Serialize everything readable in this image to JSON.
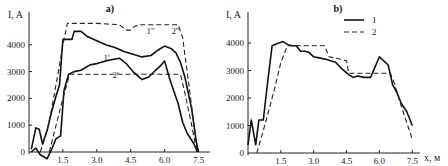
{
  "chart_data": [
    {
      "type": "line",
      "title": "a)",
      "xlabel": "",
      "ylabel": "I, A",
      "xlim": [
        0,
        8.2
      ],
      "ylim": [
        0,
        4800
      ],
      "x_ticks": [
        "1.5",
        "3.0",
        "4.5",
        "6.0",
        "7.5"
      ],
      "x_tick_values": [
        1.5,
        3.0,
        4.5,
        6.0,
        7.5
      ],
      "y_ticks": [
        "0",
        "1000",
        "2000",
        "3000",
        "4000"
      ],
      "y_tick_values": [
        0,
        1000,
        2000,
        3000,
        4000
      ],
      "grid": false,
      "annotations": [
        {
          "text": "1''",
          "x": 5.2,
          "y": 4400
        },
        {
          "text": "2''",
          "x": 6.3,
          "y": 4400
        },
        {
          "text": "1'",
          "x": 3.3,
          "y": 3400
        },
        {
          "text": "2'",
          "x": 3.7,
          "y": 2750
        }
      ],
      "series": [
        {
          "name": "1''",
          "style": "solid",
          "x": [
            0.1,
            0.3,
            0.45,
            0.6,
            0.8,
            1.0,
            1.2,
            1.35,
            1.5,
            1.9,
            2.0,
            2.3,
            2.6,
            3.0,
            3.4,
            3.8,
            4.2,
            4.6,
            5.0,
            5.4,
            5.7,
            6.0,
            6.3,
            6.5,
            6.7,
            6.9,
            7.2,
            7.4,
            7.5
          ],
          "y": [
            100,
            900,
            850,
            300,
            800,
            1500,
            2100,
            2500,
            4200,
            4200,
            4500,
            4500,
            4300,
            4150,
            4000,
            3900,
            3750,
            3650,
            3550,
            3600,
            3800,
            3950,
            3850,
            3700,
            3350,
            2800,
            1600,
            400,
            0
          ]
        },
        {
          "name": "1'",
          "style": "solid",
          "x": [
            0.1,
            0.3,
            0.5,
            0.8,
            1.0,
            1.2,
            1.4,
            1.55,
            1.75,
            2.0,
            2.3,
            2.7,
            3.0,
            3.4,
            3.7,
            4.0,
            4.3,
            4.6,
            5.0,
            5.3,
            5.6,
            5.8,
            6.0,
            6.2,
            6.4,
            6.6,
            6.8,
            7.0,
            7.3,
            7.45
          ],
          "y": [
            0,
            150,
            -100,
            -250,
            100,
            500,
            600,
            2300,
            2900,
            3000,
            3050,
            3250,
            3300,
            3400,
            3450,
            3500,
            3300,
            3000,
            2700,
            2800,
            3050,
            3200,
            3400,
            2800,
            2300,
            1800,
            1100,
            700,
            300,
            0
          ]
        },
        {
          "name": "2''",
          "style": "dashed",
          "x": [
            0.5,
            0.8,
            1.0,
            1.3,
            1.5,
            1.7,
            2.0,
            3.0,
            4.0,
            4.3,
            4.5,
            4.7,
            5.0,
            5.5,
            6.0,
            6.6,
            6.8,
            7.0,
            7.45
          ],
          "y": [
            0,
            800,
            1600,
            3000,
            4000,
            4800,
            4800,
            4800,
            4750,
            4550,
            4550,
            4700,
            4750,
            4750,
            4750,
            4750,
            4250,
            3000,
            0
          ]
        },
        {
          "name": "2'",
          "style": "dashed",
          "x": [
            0.9,
            1.2,
            1.5,
            1.8,
            2.2,
            3.0,
            4.0,
            5.0,
            6.0,
            6.7,
            6.9,
            7.2,
            7.4
          ],
          "y": [
            0,
            1000,
            2000,
            2900,
            2900,
            2900,
            2900,
            2900,
            2900,
            2900,
            2200,
            1000,
            100
          ]
        }
      ]
    },
    {
      "type": "line",
      "title": "b)",
      "xlabel": "x, м",
      "ylabel": "I, A",
      "xlim": [
        0,
        8.3
      ],
      "ylim": [
        0,
        4800
      ],
      "x_ticks": [
        "1.5",
        "3.0",
        "4.5",
        "6.0",
        "7.5"
      ],
      "x_tick_values": [
        1.5,
        3.0,
        4.5,
        6.0,
        7.5
      ],
      "y_ticks": [
        "0",
        "1000",
        "2000",
        "3000",
        "4000"
      ],
      "y_tick_values": [
        0,
        1000,
        2000,
        3000,
        4000
      ],
      "grid": false,
      "legend": {
        "placement": "top-center",
        "entries": [
          {
            "label": "1",
            "style": "solid"
          },
          {
            "label": "2",
            "style": "dashed"
          }
        ]
      },
      "series": [
        {
          "name": "1",
          "style": "solid",
          "x": [
            0.0,
            0.15,
            0.35,
            0.5,
            0.7,
            0.9,
            1.1,
            1.4,
            1.6,
            1.8,
            2.0,
            2.2,
            2.4,
            2.6,
            2.8,
            3.0,
            3.3,
            3.6,
            4.0,
            4.3,
            4.6,
            4.8,
            5.0,
            5.3,
            5.6,
            6.0,
            6.4,
            6.6,
            6.8,
            7.0,
            7.25,
            7.5
          ],
          "y": [
            300,
            1200,
            300,
            1200,
            1200,
            2600,
            3900,
            4000,
            4050,
            3950,
            3900,
            3900,
            3700,
            3700,
            3650,
            3500,
            3450,
            3400,
            3300,
            3050,
            2850,
            2750,
            2800,
            2750,
            2750,
            3500,
            3200,
            2500,
            2200,
            1800,
            1500,
            1000
          ]
        },
        {
          "name": "2",
          "style": "dashed",
          "x": [
            0.4,
            0.8,
            1.2,
            1.5,
            1.8,
            2.1,
            2.5,
            3.0,
            3.5,
            3.7,
            4.0,
            4.3,
            4.5,
            4.6,
            5.0,
            5.5,
            6.0,
            6.5,
            6.7,
            7.0,
            7.5
          ],
          "y": [
            0,
            1100,
            2300,
            3300,
            3900,
            3900,
            3900,
            3900,
            3900,
            3500,
            3450,
            3400,
            3350,
            2900,
            2900,
            2900,
            2900,
            2900,
            2500,
            1700,
            500
          ]
        }
      ]
    }
  ]
}
